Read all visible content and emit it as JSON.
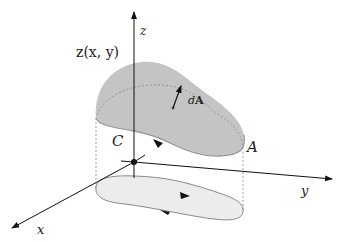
{
  "diagram": {
    "labels": {
      "z_axis": "z",
      "y_axis": "y",
      "x_axis": "x",
      "surface_function": "z(x, y)",
      "area_element_d": "d",
      "area_element_A": "A",
      "boundary_curve": "C",
      "surface_area": "A"
    },
    "colors": {
      "surface_fill": "#c4c4c4",
      "surface_edge": "#9a9a9a",
      "projection_fill": "#ececec",
      "projection_edge": "#8a8a8a",
      "axis": "#111111",
      "dashed": "#8c8c8c"
    }
  }
}
